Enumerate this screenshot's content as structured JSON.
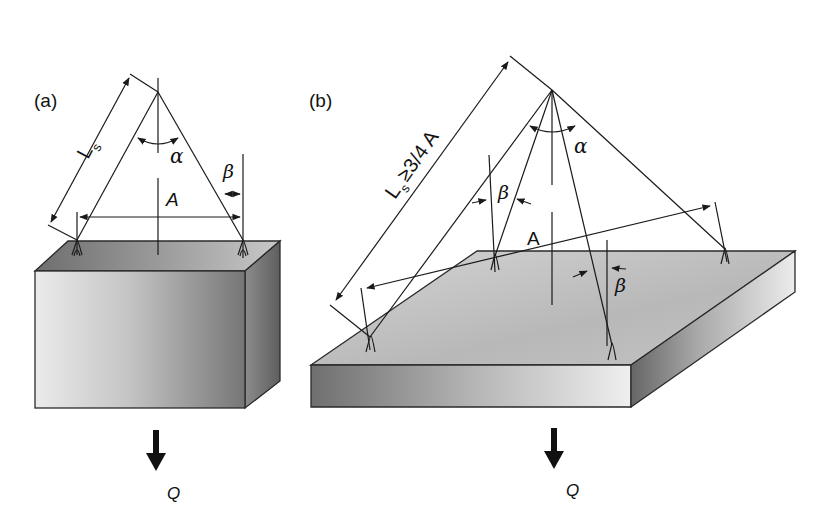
{
  "figure": {
    "panels": [
      {
        "id": "a",
        "label": "(a)",
        "description": "Two-leg sling lifting a rectangular block",
        "labels": {
          "sling_length": "L",
          "sling_length_sub": "s",
          "angle_alpha": "α",
          "angle_beta": "β",
          "span": "A",
          "load": "Q"
        }
      },
      {
        "id": "b",
        "label": "(b)",
        "description": "Four-leg sling lifting a flat plate",
        "labels": {
          "sling_length": "L",
          "sling_length_sub": "s",
          "sling_length_condition": "≥3/4 A",
          "angle_alpha": "α",
          "angle_beta_1": "β",
          "angle_beta_2": "β",
          "span": "A",
          "load": "Q"
        }
      }
    ],
    "colors": {
      "line": "#1a1a1a",
      "box_front_light": "#e6e6e6",
      "box_front_dark": "#7a7a7a",
      "box_top": "#8f8f8f",
      "box_side": "#6e6e6e",
      "plate_top": "#bdbdbd",
      "plate_front_dark": "#7d7d7d",
      "plate_front_light": "#e8e8e8",
      "plate_side": "#8a8a8a"
    }
  }
}
